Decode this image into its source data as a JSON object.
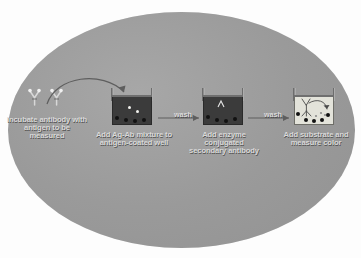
{
  "figure": {
    "background_color": "#9a9a9a",
    "outside_color": "#fdfdfd",
    "label_text_color": "#d9d9d9",
    "well_dark_color": "#3b3b3b",
    "well_light_color": "#e3e3da"
  },
  "steps": [
    {
      "id": "step-1",
      "label": "Incubate antibody with antigen to be measured",
      "icon": "antibody-pair-icon"
    },
    {
      "id": "step-2",
      "label": "Add Ag-Ab mixture to antigen-coated well",
      "icon": "microwell-plate-dark-icon"
    },
    {
      "id": "step-3",
      "label": "Add enzyme conjugated secondary antibody",
      "icon": "microwell-plate-dark-icon"
    },
    {
      "id": "step-4",
      "label": "Add substrate and measure color",
      "icon": "microwell-plate-light-icon"
    }
  ],
  "transitions": [
    {
      "id": "transition-1",
      "label": "",
      "icon": "curved-arrow-icon"
    },
    {
      "id": "transition-2",
      "label": "wash",
      "icon": "right-arrow-icon"
    },
    {
      "id": "transition-3",
      "label": "wash",
      "icon": "right-arrow-icon"
    }
  ]
}
